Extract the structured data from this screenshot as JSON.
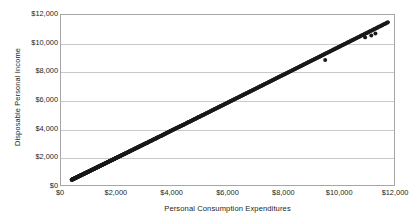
{
  "chart_data": {
    "type": "scatter",
    "title": "",
    "xlabel": "Personal Consumption Expenditures",
    "ylabel": "Disposable Personal Income",
    "xlim": [
      0,
      12000
    ],
    "ylim": [
      0,
      12000
    ],
    "xticks": [
      "$0",
      "$2,000",
      "$4,000",
      "$6,000",
      "$8,000",
      "$10,000",
      "$12,000"
    ],
    "xtick_values": [
      0,
      2000,
      4000,
      6000,
      8000,
      10000,
      12000
    ],
    "yticks": [
      "$0",
      "$2,000",
      "$4,000",
      "$6,000",
      "$8,000",
      "$10,000",
      "$12,000"
    ],
    "ytick_values": [
      0,
      2000,
      4000,
      6000,
      8000,
      10000,
      12000
    ],
    "grid": "horizontal",
    "legend": "none",
    "marker_color": "#1a1a1a",
    "marker_size": 2.0,
    "frame_color": "#a6a6a6",
    "gridline_color": "#c9c9c9",
    "background": "#ffffff",
    "relationship": "Nearly perfect positive linear relationship; disposable personal income slightly exceeds consumption expenditures across the full range.",
    "points": [
      [
        382,
        362
      ],
      [
        409,
        389
      ],
      [
        432,
        410
      ],
      [
        452,
        432
      ],
      [
        470,
        449
      ],
      [
        506,
        481
      ],
      [
        528,
        504
      ],
      [
        558,
        533
      ],
      [
        582,
        556
      ],
      [
        610,
        584
      ],
      [
        640,
        611
      ],
      [
        668,
        639
      ],
      [
        695,
        664
      ],
      [
        722,
        690
      ],
      [
        751,
        718
      ],
      [
        784,
        750
      ],
      [
        812,
        778
      ],
      [
        840,
        803
      ],
      [
        868,
        830
      ],
      [
        899,
        861
      ],
      [
        930,
        890
      ],
      [
        962,
        920
      ],
      [
        990,
        948
      ],
      [
        1022,
        978
      ],
      [
        1055,
        1010
      ],
      [
        1088,
        1042
      ],
      [
        1120,
        1073
      ],
      [
        1152,
        1104
      ],
      [
        1188,
        1138
      ],
      [
        1222,
        1170
      ],
      [
        1258,
        1205
      ],
      [
        1292,
        1238
      ],
      [
        1330,
        1274
      ],
      [
        1366,
        1309
      ],
      [
        1402,
        1343
      ],
      [
        1440,
        1380
      ],
      [
        1478,
        1416
      ],
      [
        1518,
        1455
      ],
      [
        1556,
        1492
      ],
      [
        1598,
        1532
      ],
      [
        1640,
        1572
      ],
      [
        1682,
        1613
      ],
      [
        1724,
        1654
      ],
      [
        1768,
        1696
      ],
      [
        1812,
        1738
      ],
      [
        1858,
        1783
      ],
      [
        1902,
        1826
      ],
      [
        1948,
        1870
      ],
      [
        1996,
        1916
      ],
      [
        2042,
        1961
      ],
      [
        2090,
        2007
      ],
      [
        2140,
        2055
      ],
      [
        2188,
        2102
      ],
      [
        2240,
        2152
      ],
      [
        2292,
        2202
      ],
      [
        2344,
        2252
      ],
      [
        2398,
        2304
      ],
      [
        2450,
        2355
      ],
      [
        2506,
        2408
      ],
      [
        2560,
        2461
      ],
      [
        2618,
        2516
      ],
      [
        2674,
        2570
      ],
      [
        2732,
        2626
      ],
      [
        2790,
        2682
      ],
      [
        2850,
        2740
      ],
      [
        2908,
        2796
      ],
      [
        2970,
        2855
      ],
      [
        3030,
        2913
      ],
      [
        3092,
        2973
      ],
      [
        3156,
        3035
      ],
      [
        3218,
        3096
      ],
      [
        3284,
        3160
      ],
      [
        3348,
        3222
      ],
      [
        3414,
        3286
      ],
      [
        3480,
        3350
      ],
      [
        3548,
        3416
      ],
      [
        3616,
        3482
      ],
      [
        3684,
        3548
      ],
      [
        3754,
        3616
      ],
      [
        3824,
        3684
      ],
      [
        3896,
        3754
      ],
      [
        3966,
        3822
      ],
      [
        4040,
        3894
      ],
      [
        4112,
        3964
      ],
      [
        4186,
        4036
      ],
      [
        4262,
        4110
      ],
      [
        4336,
        4182
      ],
      [
        4414,
        4258
      ],
      [
        4490,
        4332
      ],
      [
        4568,
        4408
      ],
      [
        4648,
        4486
      ],
      [
        4726,
        4562
      ],
      [
        4808,
        4642
      ],
      [
        4888,
        4720
      ],
      [
        4970,
        4800
      ],
      [
        5054,
        4882
      ],
      [
        5136,
        4962
      ],
      [
        5222,
        5046
      ],
      [
        5306,
        5128
      ],
      [
        5392,
        5212
      ],
      [
        5480,
        5298
      ],
      [
        5566,
        5382
      ],
      [
        5656,
        5470
      ],
      [
        5744,
        5556
      ],
      [
        5836,
        5646
      ],
      [
        5926,
        5734
      ],
      [
        6018,
        5824
      ],
      [
        6112,
        5916
      ],
      [
        6204,
        6006
      ],
      [
        6300,
        6100
      ],
      [
        6394,
        6192
      ],
      [
        6492,
        6288
      ],
      [
        6588,
        6382
      ],
      [
        6686,
        6478
      ],
      [
        6786,
        6576
      ],
      [
        6884,
        6672
      ],
      [
        6986,
        6772
      ],
      [
        7086,
        6870
      ],
      [
        7190,
        6972
      ],
      [
        7292,
        7072
      ],
      [
        7396,
        7174
      ],
      [
        7502,
        7278
      ],
      [
        7606,
        7380
      ],
      [
        7714,
        7486
      ],
      [
        7820,
        7590
      ],
      [
        7928,
        7696
      ],
      [
        8038,
        7804
      ],
      [
        8146,
        7910
      ],
      [
        8258,
        8020
      ],
      [
        8368,
        8128
      ],
      [
        8480,
        8238
      ],
      [
        8594,
        8350
      ],
      [
        8706,
        8460
      ],
      [
        8822,
        8574
      ],
      [
        8936,
        8686
      ],
      [
        9052,
        8800
      ],
      [
        9170,
        8916
      ],
      [
        9286,
        9030
      ],
      [
        9404,
        9146
      ],
      [
        9524,
        9264
      ],
      [
        9642,
        9380
      ],
      [
        9762,
        9498
      ],
      [
        9884,
        9618
      ],
      [
        10004,
        9736
      ],
      [
        10128,
        9858
      ],
      [
        10250,
        9978
      ],
      [
        10374,
        10100
      ],
      [
        10500,
        10224
      ],
      [
        10624,
        10346
      ],
      [
        10750,
        10470
      ],
      [
        10878,
        10596
      ],
      [
        11004,
        10720
      ],
      [
        11134,
        10848
      ],
      [
        11262,
        10974
      ],
      [
        11392,
        11102
      ],
      [
        11520,
        11228
      ],
      [
        11650,
        11356
      ],
      [
        11780,
        11484
      ]
    ],
    "outliers": [
      [
        9520,
        8820
      ],
      [
        11180,
        10560
      ],
      [
        11330,
        10690
      ],
      [
        10960,
        10420
      ]
    ],
    "n_points": 161
  }
}
